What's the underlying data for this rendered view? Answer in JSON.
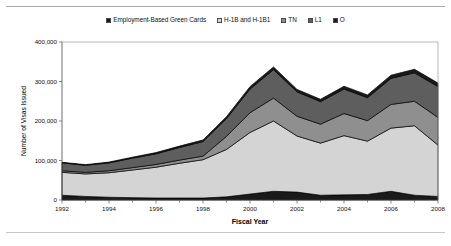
{
  "figure": {
    "background": "#ffffff",
    "rule_color": "#a8a8a8"
  },
  "legend": {
    "position": "top-center",
    "items": [
      {
        "label": "Employment-Based Green Cards",
        "color": "#1a1a1a",
        "icon": "square-swatch-icon"
      },
      {
        "label": "H-1B and H-1B1",
        "color": "#d4d4d4",
        "icon": "square-swatch-icon"
      },
      {
        "label": "TN",
        "color": "#8f8f8f",
        "icon": "square-swatch-icon"
      },
      {
        "label": "L1",
        "color": "#5e5e5e",
        "icon": "square-swatch-icon"
      },
      {
        "label": "O",
        "color": "#1a1a1a",
        "icon": "square-swatch-icon"
      }
    ]
  },
  "chart_data": {
    "type": "area",
    "stacked": true,
    "title": "",
    "xlabel": "Fiscal Year",
    "ylabel": "Number of Visas Issued",
    "grid": false,
    "xlim": [
      1992,
      2008
    ],
    "ylim": [
      0,
      400000
    ],
    "ytick_labels": [
      "0",
      "100,000",
      "200,000",
      "300,000",
      "400,000"
    ],
    "yticks": [
      0,
      100000,
      200000,
      300000,
      400000
    ],
    "x": [
      1992,
      1993,
      1994,
      1995,
      1996,
      1997,
      1998,
      1999,
      2000,
      2001,
      2002,
      2003,
      2004,
      2005,
      2006,
      2007,
      2008
    ],
    "xtick_labels": [
      "1992",
      "1994",
      "1996",
      "1998",
      "2000",
      "2002",
      "2004",
      "2006",
      "2008"
    ],
    "xticks": [
      1992,
      1994,
      1996,
      1998,
      2000,
      2002,
      2004,
      2006,
      2008
    ],
    "xtick_minor": [
      1993,
      1995,
      1997,
      1999,
      2001,
      2003,
      2005,
      2007
    ],
    "series": [
      {
        "name": "Employment-Based Green Cards",
        "color": "#1a1a1a",
        "values": [
          12000,
          9000,
          7000,
          6000,
          5000,
          5000,
          5000,
          8000,
          15000,
          22000,
          20000,
          12000,
          13000,
          14000,
          22000,
          12000,
          9000
        ]
      },
      {
        "name": "H-1B and H-1B1",
        "color": "#d4d4d4",
        "values": [
          58000,
          57000,
          62000,
          70000,
          78000,
          88000,
          97000,
          120000,
          156000,
          178000,
          142000,
          132000,
          150000,
          135000,
          160000,
          176000,
          130000
        ]
      },
      {
        "name": "TN",
        "color": "#8f8f8f",
        "values": [
          4000,
          4000,
          5000,
          6000,
          7000,
          8000,
          9000,
          33000,
          50000,
          58000,
          50000,
          48000,
          56000,
          52000,
          60000,
          62000,
          70000
        ]
      },
      {
        "name": "L1",
        "color": "#5e5e5e",
        "values": [
          20000,
          18000,
          20000,
          24000,
          27000,
          32000,
          37000,
          45000,
          60000,
          72000,
          62000,
          57000,
          62000,
          58000,
          66000,
          72000,
          78000
        ]
      },
      {
        "name": "O",
        "color": "#1a1a1a",
        "values": [
          1500,
          1500,
          2000,
          2500,
          3000,
          3500,
          4000,
          5000,
          6000,
          7000,
          6000,
          6000,
          7000,
          7000,
          8000,
          9000,
          9000
        ]
      }
    ],
    "totals": [
      95500,
      89500,
      96000,
      108500,
      120000,
      136500,
      152000,
      211000,
      287000,
      337000,
      280000,
      255000,
      288000,
      266000,
      316000,
      331000,
      296000
    ]
  }
}
